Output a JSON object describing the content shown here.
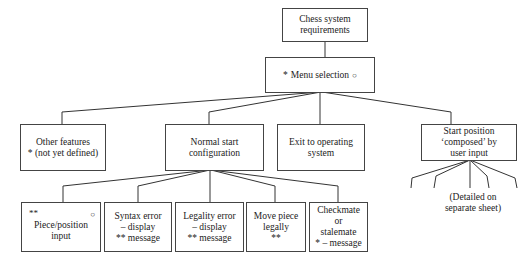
{
  "title": [
    "Chess system",
    "requirements"
  ],
  "menu": {
    "prefix": "*",
    "label": "Menu selection",
    "suffix": "○"
  },
  "level2": {
    "other": [
      "Other features",
      "* (not yet defined)"
    ],
    "normal": [
      "Normal start",
      "configuration"
    ],
    "exit": [
      "Exit to operating",
      "system"
    ],
    "start": [
      "Start position",
      "‘composed’ by",
      "user input"
    ]
  },
  "level3": {
    "piece": {
      "mark": "**",
      "ring": "○",
      "lines": [
        "Piece/position",
        "input"
      ]
    },
    "syntax": [
      "Syntax error",
      "– display",
      "** message"
    ],
    "legality": [
      "Legality error",
      "– display",
      "** message"
    ],
    "move": [
      "Move piece",
      "legally",
      "**"
    ],
    "checkmate": [
      "Checkmate",
      "or",
      "stalemate",
      "* – message"
    ]
  },
  "detail_note": [
    "(Detailed on",
    "separate sheet)"
  ]
}
